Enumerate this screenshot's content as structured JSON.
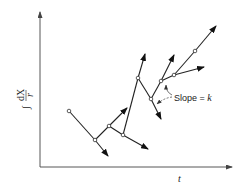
{
  "figure": {
    "type": "diagram",
    "x_axis_label": "t",
    "y_axis_label": "∫ dX / r",
    "y_axis_label_parts": {
      "integral": "∫",
      "numerator": "dX",
      "denominator": "r"
    },
    "annotation": {
      "text": "Slope = k",
      "prefix": "Slope = ",
      "symbol": "k"
    },
    "nodes": [
      {
        "id": 1,
        "x": 69,
        "y": 111
      },
      {
        "id": 2,
        "x": 95,
        "y": 140
      },
      {
        "id": 3,
        "x": 109,
        "y": 126
      },
      {
        "id": 4,
        "x": 123,
        "y": 135
      },
      {
        "id": 5,
        "x": 138,
        "y": 78
      },
      {
        "id": 6,
        "x": 151,
        "y": 99
      },
      {
        "id": 7,
        "x": 161,
        "y": 81
      },
      {
        "id": 8,
        "x": 174,
        "y": 75
      },
      {
        "id": 9,
        "x": 195,
        "y": 51
      }
    ],
    "arrows": [
      {
        "from": 2,
        "to": [
          108,
          156
        ]
      },
      {
        "from": 3,
        "to": [
          127,
          108
        ]
      },
      {
        "from": 4,
        "to": [
          148,
          149
        ]
      },
      {
        "from": 5,
        "to": [
          145,
          54
        ]
      },
      {
        "from": 6,
        "to": [
          161,
          119
        ]
      },
      {
        "from": 7,
        "to": [
          174,
          55
        ]
      },
      {
        "from": 8,
        "to": [
          204,
          67
        ]
      },
      {
        "from": 9,
        "to": [
          216,
          26
        ]
      }
    ]
  }
}
